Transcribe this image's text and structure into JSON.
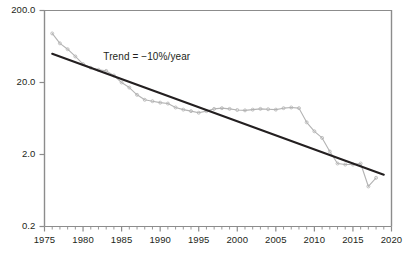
{
  "chart_data": {
    "type": "line",
    "title": "",
    "xlabel": "",
    "ylabel": "",
    "yscale": "log",
    "xlim": [
      1975,
      2020
    ],
    "ylim": [
      0.2,
      200.0
    ],
    "grid": false,
    "legend": null,
    "y_ticks": [
      "200.0",
      "20.0",
      "2.0",
      "0.2"
    ],
    "y_tick_values": [
      200.0,
      20.0,
      2.0,
      0.2
    ],
    "x_ticks": [
      "1975",
      "1980",
      "1985",
      "1990",
      "1995",
      "2000",
      "2005",
      "2010",
      "2015",
      "2020"
    ],
    "x_tick_values": [
      1975,
      1980,
      1985,
      1990,
      1995,
      2000,
      2005,
      2010,
      2015,
      2020
    ],
    "x_minor_tick_step": 1,
    "annotations": [
      {
        "text": "Trend = −10%/year",
        "x": 1989.5,
        "y": 44.0
      }
    ],
    "series": [
      {
        "name": "data",
        "style": "line-markers",
        "color": "#b3b3b3",
        "x": [
          1976,
          1977,
          1978,
          1979,
          1980,
          1981,
          1982,
          1983,
          1984,
          1985,
          1986,
          1987,
          1988,
          1989,
          1990,
          1991,
          1992,
          1993,
          1994,
          1995,
          1996,
          1997,
          1998,
          1999,
          2000,
          2001,
          2002,
          2003,
          2004,
          2005,
          2006,
          2007,
          2008,
          2009,
          2010,
          2011,
          2012,
          2013,
          2014,
          2015,
          2016,
          2017,
          2018
        ],
        "values": [
          96.0,
          70.0,
          58.0,
          46.0,
          36.0,
          32.0,
          30.0,
          29.0,
          25.0,
          20.0,
          17.0,
          13.5,
          11.5,
          11.0,
          10.5,
          10.2,
          9.0,
          8.4,
          8.0,
          7.6,
          8.0,
          8.6,
          8.8,
          8.6,
          8.3,
          8.2,
          8.4,
          8.6,
          8.5,
          8.4,
          8.8,
          9.0,
          8.8,
          5.6,
          4.2,
          3.4,
          2.2,
          1.5,
          1.45,
          1.45,
          1.5,
          0.72,
          0.95
        ]
      },
      {
        "name": "trend",
        "style": "line",
        "color": "#231f20",
        "label": "Trend = −10%/year",
        "slope_percent_per_year": -10,
        "x": [
          1976,
          2019
        ],
        "values": [
          50.0,
          1.05
        ]
      }
    ]
  },
  "axes": {
    "frame_color": "#8c8c8c",
    "tick_color": "#8c8c8c"
  }
}
